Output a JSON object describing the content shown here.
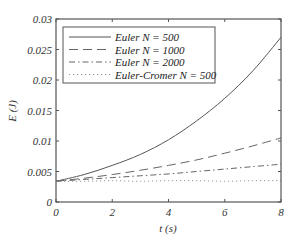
{
  "chart_data": {
    "type": "line",
    "title": "",
    "xlabel": "t (s)",
    "ylabel": "E (J)",
    "xlim": [
      0,
      8
    ],
    "ylim": [
      0,
      0.03
    ],
    "grid": false,
    "legend_position": "upper left (inside)",
    "x_ticks": [
      "0",
      "2",
      "4",
      "6",
      "8"
    ],
    "y_ticks": [
      "0",
      "0.005",
      "0.01",
      "0.015",
      "0.02",
      "0.025",
      "0.03"
    ],
    "x": [
      0,
      1,
      2,
      3,
      4,
      5,
      6,
      7,
      8
    ],
    "series": [
      {
        "name": "Euler N = 500",
        "style": "solid",
        "values": [
          0.0034,
          0.0045,
          0.006,
          0.0078,
          0.0102,
          0.0133,
          0.017,
          0.0215,
          0.027
        ]
      },
      {
        "name": "Euler N = 1000",
        "style": "long-dash",
        "values": [
          0.0034,
          0.0039,
          0.0045,
          0.0052,
          0.006,
          0.0069,
          0.008,
          0.0092,
          0.0105
        ]
      },
      {
        "name": "Euler N = 2000",
        "style": "dash-dot",
        "values": [
          0.0034,
          0.0037,
          0.004,
          0.0043,
          0.0046,
          0.005,
          0.0054,
          0.0058,
          0.0062
        ]
      },
      {
        "name": "Euler-Cromer N = 500",
        "style": "dotted",
        "values": [
          0.0034,
          0.0034,
          0.0035,
          0.0034,
          0.0035,
          0.0035,
          0.0034,
          0.0035,
          0.0035
        ]
      }
    ]
  },
  "legend": {
    "items": [
      {
        "label": "Euler N = 500"
      },
      {
        "label": "Euler N = 1000"
      },
      {
        "label": "Euler N = 2000"
      },
      {
        "label": "Euler-Cromer N = 500"
      }
    ]
  },
  "axes": {
    "xlabel": "t (s)",
    "ylabel": "E (J)"
  }
}
